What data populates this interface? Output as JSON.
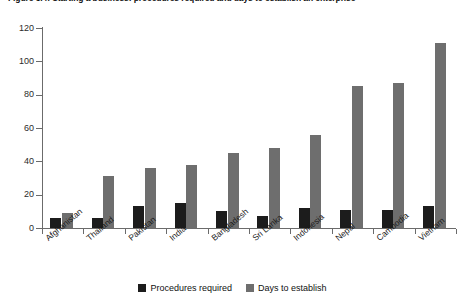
{
  "chart_data": {
    "type": "bar",
    "title": "Figure 3.4: Starting a business: procedures required and days to establish an enterprise",
    "xlabel": "",
    "ylabel": "",
    "ylim": [
      0,
      120
    ],
    "yticks": [
      0,
      20,
      40,
      60,
      80,
      100,
      120
    ],
    "grid": false,
    "legend_position": "bottom",
    "categories": [
      "Afghanistan",
      "Thailand",
      "Pakistan",
      "India",
      "Bangladesh",
      "Sri Lanka",
      "Indonesia",
      "Nepal",
      "Cambodia",
      "Vietnam"
    ],
    "series": [
      {
        "name": "Procedures required",
        "color": "#1c1c1c",
        "values": [
          6,
          6,
          13,
          15,
          10,
          7,
          12,
          11,
          11,
          13
        ]
      },
      {
        "name": "Days to establish",
        "color": "#6e6e6e",
        "values": [
          9,
          31,
          36,
          38,
          45,
          48,
          56,
          85,
          87,
          111
        ]
      }
    ]
  },
  "legend": {
    "items": [
      {
        "label": "Procedures required",
        "color": "#1c1c1c"
      },
      {
        "label": "Days to establish",
        "color": "#6e6e6e"
      }
    ]
  }
}
